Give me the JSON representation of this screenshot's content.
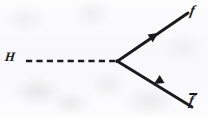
{
  "diagram": {
    "kind": "feynman-diagram",
    "background_color": "#fbfbfc",
    "ink_color": "#1b1b1d",
    "labels": {
      "higgs": "H",
      "fermion": "f",
      "antifermion": "f",
      "antifermion_has_overbar": true
    },
    "vertex": {
      "name": "interaction-vertex",
      "x": 118,
      "y": 61
    },
    "lines": [
      {
        "name": "higgs-propagator",
        "style": "dashed",
        "label": "H",
        "x1": 26,
        "y1": 61,
        "x2": 118,
        "y2": 61,
        "dash_pattern": "6 4",
        "stroke_width": 2.6,
        "arrow": "none"
      },
      {
        "name": "fermion-line-upper",
        "style": "solid",
        "label": "f",
        "x1": 118,
        "y1": 61,
        "x2": 188,
        "y2": 13,
        "stroke_width": 2.8,
        "arrow": "outgoing",
        "arrow_x": 158,
        "arrow_y": 33
      },
      {
        "name": "antifermion-line-lower",
        "style": "solid",
        "label": "f",
        "x1": 118,
        "y1": 61,
        "x2": 192,
        "y2": 107,
        "stroke_width": 2.8,
        "arrow": "incoming",
        "arrow_x": 160,
        "arrow_y": 87
      }
    ]
  }
}
